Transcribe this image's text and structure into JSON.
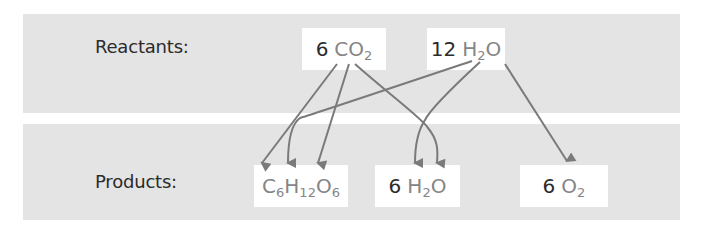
{
  "diagram": {
    "rows": {
      "reactants_label": "Reactants:",
      "products_label": "Products:"
    },
    "reactants": [
      {
        "id": "co2",
        "coefficient": "6",
        "formula": [
          {
            "el": "CO",
            "sub": "2"
          }
        ]
      },
      {
        "id": "h2o",
        "coefficient": "12",
        "formula": [
          {
            "el": "H",
            "sub": "2"
          },
          {
            "el": "O",
            "sub": ""
          }
        ]
      }
    ],
    "products": [
      {
        "id": "glucose",
        "coefficient": "",
        "formula": [
          {
            "el": "C",
            "sub": "6"
          },
          {
            "el": "H",
            "sub": "12"
          },
          {
            "el": "O",
            "sub": "6"
          }
        ]
      },
      {
        "id": "water",
        "coefficient": "6",
        "formula": [
          {
            "el": "H",
            "sub": "2"
          },
          {
            "el": "O",
            "sub": ""
          }
        ]
      },
      {
        "id": "oxygen",
        "coefficient": "6",
        "formula": [
          {
            "el": "O",
            "sub": "2"
          }
        ]
      }
    ],
    "arrows": [
      {
        "from": "6 CO2",
        "to": "C6H12O6 (C)"
      },
      {
        "from": "6 CO2",
        "to": "C6H12O6 (O)"
      },
      {
        "from": "6 CO2",
        "to": "6 H2O (O)"
      },
      {
        "from": "12 H2O",
        "to": "C6H12O6 (H)"
      },
      {
        "from": "12 H2O",
        "to": "6 H2O (H)"
      },
      {
        "from": "12 H2O",
        "to": "6 O2"
      }
    ],
    "colors": {
      "band": "#e4e4e4",
      "box": "#ffffff",
      "text": "#2b2b2b",
      "element": "#858585",
      "arrow": "#7a7a7a"
    }
  }
}
